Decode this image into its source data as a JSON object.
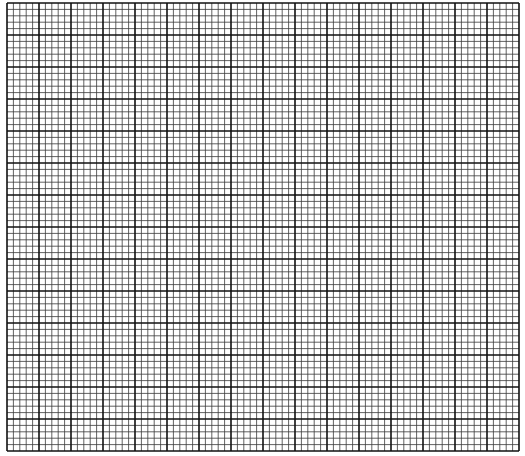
{
  "graph_paper": {
    "origin_x": 7,
    "origin_y": 3,
    "major_cols": 16,
    "major_rows": 14,
    "major_size": 32,
    "subdivisions": 5,
    "colors": {
      "background": "#ffffff",
      "minor_line": "#3a3a3a",
      "major_line": "#111111"
    },
    "minor_width": 0.8,
    "major_width": 1.6
  }
}
